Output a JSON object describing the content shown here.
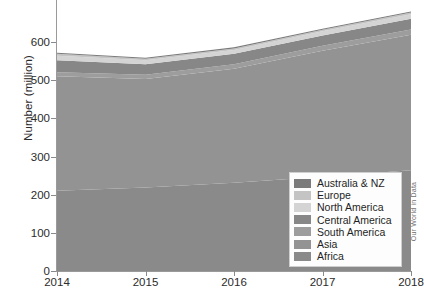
{
  "chart_data": {
    "type": "area",
    "stacked": true,
    "title": "",
    "subtitle": "",
    "xlabel": "",
    "ylabel": "Number (million)",
    "x": [
      2014,
      2015,
      2016,
      2017,
      2018
    ],
    "xtick_labels": [
      "2014",
      "2015",
      "2016",
      "2017",
      "2018"
    ],
    "ytick_labels": [
      "0",
      "100",
      "200",
      "300",
      "400",
      "500",
      "600"
    ],
    "ytick_values": [
      0,
      100,
      200,
      300,
      400,
      500,
      600
    ],
    "xlim": [
      2014,
      2018
    ],
    "ylim": [
      0,
      715
    ],
    "grid": false,
    "legend_position": "bottom-right",
    "series": [
      {
        "name": "Africa",
        "color": "#8a8a8a",
        "values": [
          210,
          219,
          231,
          247,
          264
        ]
      },
      {
        "name": "Asia",
        "color": "#939393",
        "values": [
          300,
          284,
          299,
          330,
          355
        ]
      },
      {
        "name": "South America",
        "color": "#9d9d9d",
        "values": [
          11,
          11,
          12,
          13,
          14
        ]
      },
      {
        "name": "Central America",
        "color": "#878787",
        "values": [
          31,
          28,
          27,
          27,
          28
        ]
      },
      {
        "name": "North America",
        "color": "#d4d4d4",
        "values": [
          12,
          10,
          10,
          11,
          12
        ]
      },
      {
        "name": "Europe",
        "color": "#c4c4c4",
        "values": [
          5,
          4,
          4,
          4,
          4
        ]
      },
      {
        "name": "Australia & NZ",
        "color": "#7b7b7b",
        "values": [
          3,
          3,
          3,
          3,
          3
        ]
      }
    ],
    "totals": [
      572,
      559,
      586,
      635,
      680
    ],
    "legend_order_top_to_bottom": [
      "Australia & NZ",
      "Europe",
      "North America",
      "Central America",
      "South America",
      "Asia",
      "Africa"
    ]
  },
  "axes": {
    "y_label": "Number (million)",
    "y_ticks": [
      {
        "label": "0",
        "value": 0
      },
      {
        "label": "100",
        "value": 100
      },
      {
        "label": "200",
        "value": 200
      },
      {
        "label": "300",
        "value": 300
      },
      {
        "label": "400",
        "value": 400
      },
      {
        "label": "500",
        "value": 500
      },
      {
        "label": "600",
        "value": 600
      }
    ],
    "x_ticks": [
      {
        "label": "2014",
        "value": 2014
      },
      {
        "label": "2015",
        "value": 2015
      },
      {
        "label": "2016",
        "value": 2016
      },
      {
        "label": "2017",
        "value": 2017
      },
      {
        "label": "2018",
        "value": 2018
      }
    ]
  },
  "legend": {
    "items": [
      {
        "label": "Australia & NZ",
        "color": "#7b7b7b"
      },
      {
        "label": "Europe",
        "color": "#c4c4c4"
      },
      {
        "label": "North America",
        "color": "#d4d4d4"
      },
      {
        "label": "Central America",
        "color": "#878787"
      },
      {
        "label": "South America",
        "color": "#9d9d9d"
      },
      {
        "label": "Asia",
        "color": "#939393"
      },
      {
        "label": "Africa",
        "color": "#8a8a8a"
      }
    ]
  },
  "watermark": {
    "text": "Our World in Data"
  }
}
